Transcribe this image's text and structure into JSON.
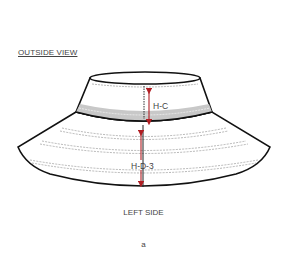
{
  "diagram": {
    "view_title": "OUTSIDE VIEW",
    "side_label": "LEFT SIDE",
    "figure_label": "a",
    "measurements": [
      {
        "id": "crown-height",
        "label": "H-C"
      },
      {
        "id": "brim-depth",
        "label": "H-D-3"
      }
    ],
    "colors": {
      "outline": "#111111",
      "band": "#c8c8c8",
      "arrow": "#b01e23",
      "stitch": "#888888"
    }
  }
}
